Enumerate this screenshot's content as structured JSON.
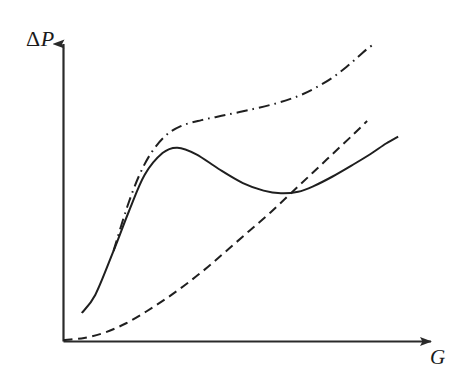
{
  "chart_data": {
    "type": "line",
    "title": "",
    "subtitle": "",
    "xlabel": "G",
    "ylabel": "ΔP",
    "grid": false,
    "legend": false,
    "legend_position": "none",
    "axis_style": "arrow-axes",
    "xlim": [
      0,
      100
    ],
    "ylim": [
      0,
      100
    ],
    "xticks": [],
    "yticks": [],
    "xticklabels": [],
    "yticklabels": [],
    "annotations": [],
    "series": [
      {
        "name": "solid-curve",
        "style": "solid",
        "color": "#1f1f1f",
        "width": 2.0,
        "points": [
          [
            5.3,
            9.5
          ],
          [
            9.2,
            15.5
          ],
          [
            14.5,
            30.2
          ],
          [
            19.0,
            43.5
          ],
          [
            23.5,
            55.5
          ],
          [
            28.7,
            62.8
          ],
          [
            33.0,
            64.6
          ],
          [
            38.5,
            62.4
          ],
          [
            45.0,
            57.5
          ],
          [
            52.0,
            52.8
          ],
          [
            58.0,
            50.3
          ],
          [
            63.0,
            49.4
          ],
          [
            68.0,
            49.9
          ],
          [
            72.5,
            51.8
          ],
          [
            78.0,
            55.0
          ],
          [
            84.0,
            59.0
          ],
          [
            89.0,
            62.5
          ],
          [
            93.5,
            66.0
          ],
          [
            97.0,
            68.3
          ]
        ]
      },
      {
        "name": "dash-dot-curve",
        "style": "dashdot",
        "color": "#1f1f1f",
        "width": 2.0,
        "points": [
          [
            14.5,
            30.2
          ],
          [
            18.5,
            45.0
          ],
          [
            22.0,
            55.5
          ],
          [
            25.5,
            63.0
          ],
          [
            29.5,
            68.5
          ],
          [
            34.0,
            71.8
          ],
          [
            40.0,
            73.8
          ],
          [
            47.0,
            75.5
          ],
          [
            55.0,
            77.5
          ],
          [
            62.0,
            79.5
          ],
          [
            68.0,
            81.8
          ],
          [
            73.0,
            84.5
          ],
          [
            78.0,
            88.0
          ],
          [
            82.0,
            91.5
          ],
          [
            85.5,
            95.0
          ],
          [
            88.0,
            97.5
          ],
          [
            89.8,
            99.0
          ]
        ]
      },
      {
        "name": "dashed-curve",
        "style": "dashed",
        "color": "#1f1f1f",
        "width": 2.0,
        "points": [
          [
            0.0,
            0.5
          ],
          [
            6.0,
            1.2
          ],
          [
            12.0,
            3.0
          ],
          [
            18.0,
            6.0
          ],
          [
            24.0,
            10.0
          ],
          [
            30.0,
            14.5
          ],
          [
            36.0,
            19.5
          ],
          [
            42.0,
            25.0
          ],
          [
            48.0,
            31.0
          ],
          [
            54.0,
            37.0
          ],
          [
            60.0,
            43.0
          ],
          [
            66.0,
            49.5
          ],
          [
            72.0,
            56.0
          ],
          [
            78.0,
            62.5
          ],
          [
            84.0,
            69.0
          ],
          [
            88.0,
            73.5
          ]
        ]
      }
    ]
  }
}
